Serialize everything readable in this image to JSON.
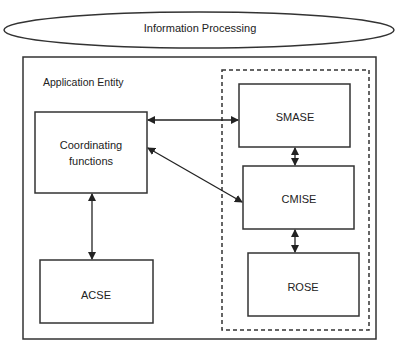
{
  "diagram": {
    "outer_label": "Information Processing",
    "entity_label": "Application Entity",
    "nodes": {
      "coordinating": {
        "line1": "Coordinating",
        "line2": "functions"
      },
      "acse": "ACSE",
      "smase": "SMASE",
      "cmise": "CMISE",
      "rose": "ROSE"
    },
    "edges": [
      {
        "from": "coordinating",
        "to": "smase",
        "type": "bidirectional"
      },
      {
        "from": "coordinating",
        "to": "cmise",
        "type": "bidirectional"
      },
      {
        "from": "coordinating",
        "to": "acse",
        "type": "bidirectional"
      },
      {
        "from": "smase",
        "to": "cmise",
        "type": "bidirectional"
      },
      {
        "from": "cmise",
        "to": "rose",
        "type": "bidirectional"
      }
    ],
    "colors": {
      "stroke": "#222222",
      "background": "#ffffff"
    }
  }
}
